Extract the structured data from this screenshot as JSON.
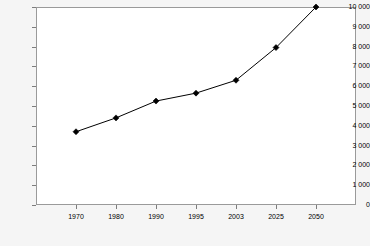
{
  "chart_data": {
    "type": "line",
    "title": "",
    "subtitle": "",
    "xlabel": "",
    "ylabel": "",
    "categories": [
      "1970",
      "1980",
      "1990",
      "1995",
      "2003",
      "2025",
      "2050"
    ],
    "values": [
      3700,
      4400,
      5250,
      5650,
      6300,
      7950,
      10000
    ],
    "series": [
      {
        "name": "",
        "values": [
          3700,
          4400,
          5250,
          5650,
          6300,
          7950,
          10000
        ],
        "line_color": "#000000",
        "marker": "diamond",
        "marker_color": "#000000"
      }
    ],
    "ylim": [
      0,
      10000
    ],
    "ytick_values": [
      0,
      1000,
      2000,
      3000,
      4000,
      5000,
      6000,
      7000,
      8000,
      9000,
      10000
    ],
    "ytick_labels": [
      "0",
      "1 000",
      "2 000",
      "3 000",
      "4 000",
      "5 000",
      "6 000",
      "7 000",
      "8 000",
      "9 000",
      "10 000"
    ],
    "xtick_labels": [
      "1970",
      "1980",
      "1990",
      "1995",
      "2003",
      "2025",
      "2050"
    ],
    "grid": false,
    "legend": false,
    "legend_position": "none",
    "annotations": [],
    "colors": {
      "plot_background": "#ffffff",
      "page_background": "#f5f5f5",
      "frame": "#9a9a9a",
      "tick": "#7d7d7d",
      "line": "#000000",
      "text": "#000000"
    }
  }
}
